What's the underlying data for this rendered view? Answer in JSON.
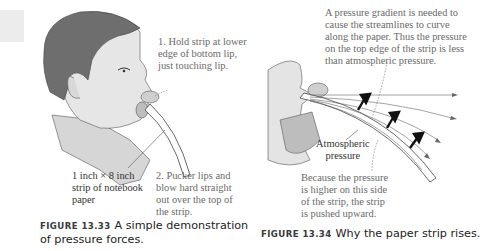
{
  "figure_left": {
    "step1": "1. Hold strip at lower\nedge of bottom lip,\njust touching lip.",
    "strip_label": "1 inch × 8 inch\nstrip of notebook\npaper",
    "step2": "2. Pucker lips and\nblow hard straight\nout over the top of\nthe strip.",
    "caption_number": "FIGURE 13.33",
    "caption_text": "A simple demonstration of pressure forces."
  },
  "figure_right": {
    "gradient_note": "A pressure gradient is needed to\ncause the streamlines to curve\nalong the paper. Thus the pressure\non the top edge of the strip is less\nthan atmospheric pressure.",
    "atmospheric_label": "Atmospheric\npressure",
    "higher_pressure_note": "Because the pressure\nis higher on this side\nof the strip, the strip\nis pushed upward.",
    "caption_number": "FIGURE 13.34",
    "caption_text": "Why the paper strip rises."
  },
  "colors": {
    "hair": "#6e6e6e",
    "skin": "#e4e4e4",
    "skin_shadow": "#c8c8c8",
    "line": "#444444",
    "note_text": "#6a6a6a"
  }
}
